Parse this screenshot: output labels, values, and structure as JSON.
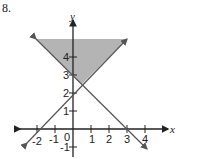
{
  "problem_number": "8.",
  "axes": {
    "x_label": "x",
    "y_label": "y",
    "x_ticks": [
      "-2",
      "-1",
      "0",
      "1",
      "2",
      "3",
      "4"
    ],
    "y_ticks": [
      "-1",
      "1",
      "2",
      "3",
      "4"
    ]
  },
  "lines": [
    {
      "name": "y = x + 2",
      "points": [
        [
          -2,
          0
        ],
        [
          0,
          2
        ]
      ]
    },
    {
      "name": "y = -x + 3",
      "points": [
        [
          0,
          3
        ],
        [
          3,
          0
        ]
      ]
    }
  ],
  "shaded_region": {
    "description": "region above both lines, bounded at top",
    "color": "#b4b4b4"
  },
  "colors": {
    "line": "#555555",
    "axis": "#222222",
    "shade": "#b4b4b4"
  }
}
